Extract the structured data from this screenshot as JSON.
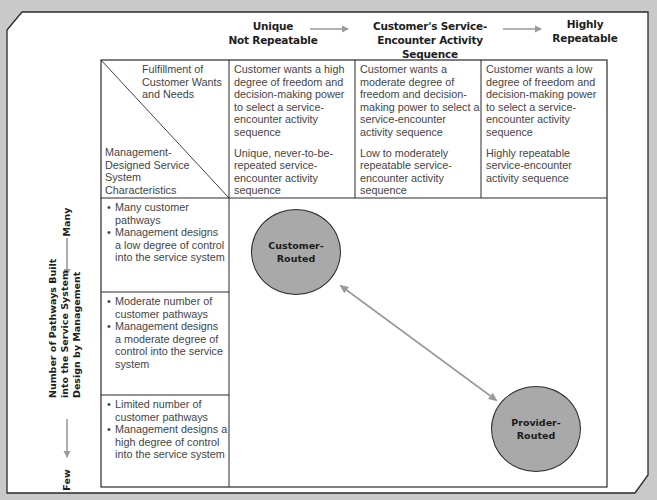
{
  "colors": {
    "background": "#c9c9c9",
    "panel": "#ffffff",
    "border": "#2a2a2a",
    "arrow": "#9a9a9a",
    "node_fill": "#a9a9a9"
  },
  "top_axis": {
    "left_label": [
      "Unique",
      "Not Repeatable"
    ],
    "center_label": [
      "Customer's Service-",
      "Encounter Activity Sequence"
    ],
    "right_label": [
      "Highly",
      "Repeatable"
    ]
  },
  "left_axis": {
    "top_label": "Many",
    "center_label": [
      "Number of Pathways Built",
      "into the Service System",
      "Design by Management"
    ],
    "bottom_label": "Few"
  },
  "table": {
    "corner": {
      "top_right_text": "Fulfillment of Customer Wants and Needs",
      "bottom_left_text": "Management-Designed Service System Characteristics"
    },
    "columns": [
      {
        "wants": "Customer wants a high degree of freedom and decision-making power to select a service-encounter activity sequence",
        "characteristics": "Unique, never-to-be-repeated service-encounter activity sequence"
      },
      {
        "wants": "Customer wants a moderate degree of freedom and decision-making power to select a service-encounter activity sequence",
        "characteristics": "Low to moderately repeatable service-encounter activity sequence"
      },
      {
        "wants": "Customer wants a low degree of freedom and decision-making power to select a service-encounter activity sequence",
        "characteristics": "Highly repeatable service-encounter activity sequence"
      }
    ],
    "rows": [
      {
        "bullets": [
          "Many customer pathways",
          "Management designs a low degree of control into the service system"
        ]
      },
      {
        "bullets": [
          "Moderate number of customer pathways",
          "Management designs a moderate degree of control into the service system"
        ]
      },
      {
        "bullets": [
          "Limited number of customer pathways",
          "Management designs a high degree of control into the service system"
        ]
      }
    ]
  },
  "nodes": {
    "customer_routed": [
      "Customer-",
      "Routed"
    ],
    "provider_routed": [
      "Provider-",
      "Routed"
    ]
  }
}
